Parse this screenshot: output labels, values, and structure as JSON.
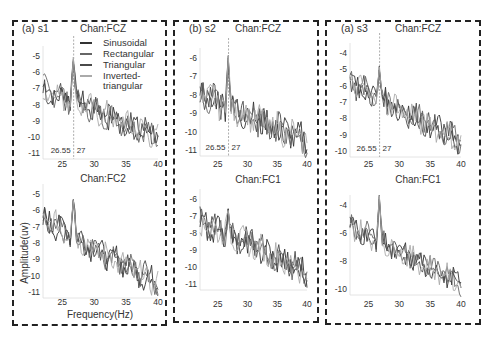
{
  "chart_data": [
    {
      "type": "line",
      "panel": "(a) s1",
      "title": "Chan:FCZ",
      "xlim": [
        22,
        40
      ],
      "ylim": [
        -11.3,
        -4.5
      ],
      "xticks": [
        25,
        30,
        35,
        40
      ],
      "yticks": [
        -5,
        -6,
        -7,
        -8,
        -9,
        -10,
        -11
      ],
      "annotations": [
        "26.55",
        "27"
      ],
      "legend": [
        "Sinusoidal",
        "Rectangular",
        "Triangular",
        "Inverted-triangular"
      ]
    },
    {
      "type": "line",
      "panel": "",
      "title": "Chan:FC2",
      "xlim": [
        22,
        40
      ],
      "ylim": [
        -11.3,
        -4.5
      ],
      "xticks": [
        25,
        30,
        35,
        40
      ],
      "yticks": [
        -5,
        -6,
        -7,
        -8,
        -9,
        -10,
        -11
      ],
      "xlabel": "Frequency(Hz)",
      "ylabel": "Amplitude(uv)"
    },
    {
      "type": "line",
      "panel": "(b) s2",
      "title": "Chan:FCZ",
      "xlim": [
        22,
        40
      ],
      "ylim": [
        -11.3,
        -5.5
      ],
      "xticks": [
        25,
        30,
        35,
        40
      ],
      "yticks": [
        -6,
        -7,
        -8,
        -9,
        -10,
        -11
      ],
      "annotations": [
        "26.55",
        "27"
      ]
    },
    {
      "type": "line",
      "panel": "",
      "title": "Chan:FC1",
      "xlim": [
        22,
        40
      ],
      "ylim": [
        -12,
        -5.5
      ],
      "xticks": [
        25,
        30,
        35,
        40
      ],
      "yticks": [
        -6,
        -7,
        -8,
        -9,
        -10,
        -11
      ]
    },
    {
      "type": "line",
      "panel": "(a) s3",
      "title": "Chan:FCZ",
      "xlim": [
        22,
        40
      ],
      "ylim": [
        -10.2,
        -3.5
      ],
      "xticks": [
        25,
        30,
        35,
        40
      ],
      "yticks": [
        -4,
        -5,
        -6,
        -7,
        -8,
        -9,
        -10
      ],
      "annotations": [
        "26.55",
        "27"
      ]
    },
    {
      "type": "line",
      "panel": "",
      "title": "Chan:FC1",
      "xlim": [
        22,
        40
      ],
      "ylim": [
        -10.8,
        -3
      ],
      "xticks": [
        25,
        30,
        35,
        40
      ],
      "yticks": [
        -4,
        -6,
        -8,
        -10
      ]
    }
  ],
  "legend": {
    "items": [
      "Sinusoidal",
      "Rectangular",
      "Triangular",
      "Inverted-",
      "triangular"
    ]
  },
  "labels": {
    "xlabel": "Frequency(Hz)",
    "ylabel": "Amplitude(uv)",
    "p1": "(a) s1",
    "p2": "(b) s2",
    "p3": "(a) s3",
    "fcz": "Chan:FCZ",
    "fc2": "Chan:FC2",
    "fc1": "Chan:FC1",
    "a1": "26.55",
    "a2": "27"
  },
  "colors": {
    "series": [
      "#333333",
      "#666666",
      "#4a4a4a",
      "#aaaaaa"
    ]
  }
}
